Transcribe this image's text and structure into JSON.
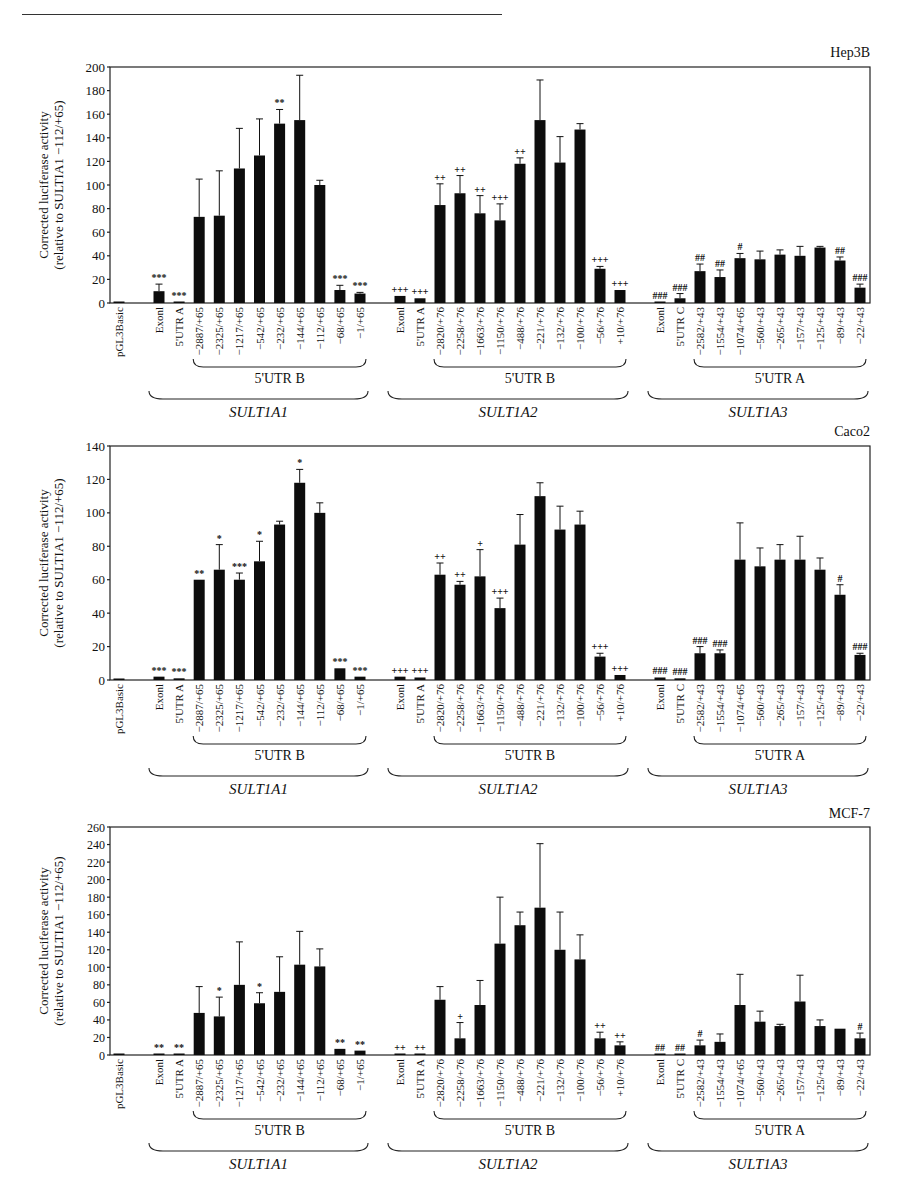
{
  "page": {
    "header_left": "[6]",
    "header_center": "RESEARCH ARTICLE"
  },
  "categories": [
    {
      "label": "pGL3Basic",
      "gene": "",
      "group": ""
    },
    {
      "label": "Exonl",
      "gene": "SULT1A1",
      "group": ""
    },
    {
      "label": "5'UTR A",
      "gene": "SULT1A1",
      "group": ""
    },
    {
      "label": "−2887/+65",
      "gene": "SULT1A1",
      "group": "5'UTR B"
    },
    {
      "label": "−2325/+65",
      "gene": "SULT1A1",
      "group": "5'UTR B"
    },
    {
      "label": "−1217/+65",
      "gene": "SULT1A1",
      "group": "5'UTR B"
    },
    {
      "label": "−542/+65",
      "gene": "SULT1A1",
      "group": "5'UTR B"
    },
    {
      "label": "−232/+65",
      "gene": "SULT1A1",
      "group": "5'UTR B"
    },
    {
      "label": "−144/+65",
      "gene": "SULT1A1",
      "group": "5'UTR B"
    },
    {
      "label": "−112/+65",
      "gene": "SULT1A1",
      "group": "5'UTR B"
    },
    {
      "label": "−68/+65",
      "gene": "SULT1A1",
      "group": "5'UTR B"
    },
    {
      "label": "−1/+65",
      "gene": "SULT1A1",
      "group": "5'UTR B"
    },
    {
      "label": "Exonl",
      "gene": "SULT1A2",
      "group": ""
    },
    {
      "label": "5'UTR A",
      "gene": "SULT1A2",
      "group": ""
    },
    {
      "label": "−2820/+76",
      "gene": "SULT1A2",
      "group": "5'UTR B"
    },
    {
      "label": "−2258/+76",
      "gene": "SULT1A2",
      "group": "5'UTR B"
    },
    {
      "label": "−1663/+76",
      "gene": "SULT1A2",
      "group": "5'UTR B"
    },
    {
      "label": "−1150/+76",
      "gene": "SULT1A2",
      "group": "5'UTR B"
    },
    {
      "label": "−488/+76",
      "gene": "SULT1A2",
      "group": "5'UTR B"
    },
    {
      "label": "−221/+76",
      "gene": "SULT1A2",
      "group": "5'UTR B"
    },
    {
      "label": "−132/+76",
      "gene": "SULT1A2",
      "group": "5'UTR B"
    },
    {
      "label": "−100/+76",
      "gene": "SULT1A2",
      "group": "5'UTR B"
    },
    {
      "label": "−56/+76",
      "gene": "SULT1A2",
      "group": "5'UTR B"
    },
    {
      "label": "+10/+76",
      "gene": "SULT1A2",
      "group": "5'UTR B"
    },
    {
      "label": "Exonl",
      "gene": "SULT1A3",
      "group": ""
    },
    {
      "label": "5'UTR C",
      "gene": "SULT1A3",
      "group": ""
    },
    {
      "label": "−2582/+43",
      "gene": "SULT1A3",
      "group": "5'UTR A"
    },
    {
      "label": "−1554/+43",
      "gene": "SULT1A3",
      "group": "5'UTR A"
    },
    {
      "label": "−1074/+65",
      "gene": "SULT1A3",
      "group": "5'UTR A"
    },
    {
      "label": "−560/+43",
      "gene": "SULT1A3",
      "group": "5'UTR A"
    },
    {
      "label": "−265/+43",
      "gene": "SULT1A3",
      "group": "5'UTR A"
    },
    {
      "label": "−157/+43",
      "gene": "SULT1A3",
      "group": "5'UTR A"
    },
    {
      "label": "−125/+43",
      "gene": "SULT1A3",
      "group": "5'UTR A"
    },
    {
      "label": "−89/+43",
      "gene": "SULT1A3",
      "group": "5'UTR A"
    },
    {
      "label": "−22/+43",
      "gene": "SULT1A3",
      "group": "5'UTR A"
    }
  ],
  "gene_groups": [
    {
      "gene": "SULT1A1",
      "subgroup": "5'UTR B"
    },
    {
      "gene": "SULT1A2",
      "subgroup": "5'UTR B"
    },
    {
      "gene": "SULT1A3",
      "subgroup": "5'UTR A"
    }
  ],
  "ylabel_line1": "Corrected luciferase activity",
  "ylabel_line2": "(relative to SULTIA1 −112/+65)",
  "chart_data": [
    {
      "type": "bar",
      "title": "Hep3B",
      "xlabel": "",
      "ylabel": "Corrected luciferase activity (relative to SULTIA1 −112/+65)",
      "ylim": [
        0,
        200
      ],
      "yticks": [
        0,
        20,
        40,
        60,
        80,
        100,
        120,
        140,
        160,
        180,
        200
      ],
      "grid": false,
      "values": [
        1,
        10,
        1,
        73,
        74,
        114,
        125,
        152,
        155,
        100,
        11,
        8,
        6,
        4,
        83,
        93,
        76,
        70,
        118,
        155,
        119,
        147,
        29,
        11,
        1,
        4,
        27,
        22,
        38,
        37,
        41,
        40,
        47,
        36,
        13
      ],
      "errors": [
        0,
        6,
        0,
        32,
        38,
        34,
        31,
        12,
        38,
        4,
        4,
        1,
        0,
        0,
        18,
        15,
        15,
        14,
        5,
        34,
        22,
        5,
        2,
        0,
        0,
        4,
        6,
        6,
        4,
        7,
        4,
        8,
        1,
        3,
        3
      ],
      "annotations": [
        "",
        "***",
        "***",
        "",
        "",
        "",
        "",
        "**",
        "",
        "",
        "***",
        "***",
        "+++",
        "+++",
        "++",
        "++",
        "++",
        "+++",
        "++",
        "",
        "",
        "",
        "+++",
        "+++",
        "###",
        "###",
        "##",
        "##",
        "#",
        "",
        "",
        "",
        "",
        "##",
        "###"
      ]
    },
    {
      "type": "bar",
      "title": "Caco2",
      "xlabel": "",
      "ylabel": "Corrected luciferase activity (relative to SULTIA1 −112/+65)",
      "ylim": [
        0,
        140
      ],
      "yticks": [
        0,
        20,
        40,
        60,
        80,
        100,
        120,
        140
      ],
      "grid": false,
      "values": [
        0.5,
        2,
        1,
        60,
        66,
        60,
        71,
        93,
        118,
        100,
        7,
        2,
        2,
        1.5,
        63,
        57,
        62,
        43,
        81,
        110,
        90,
        93,
        14,
        3,
        1.5,
        1,
        16,
        16,
        72,
        68,
        72,
        72,
        66,
        51,
        15
      ],
      "errors": [
        0,
        0,
        0,
        0,
        15,
        4,
        12,
        2,
        8,
        6,
        0,
        0,
        0,
        0,
        7,
        2,
        16,
        6,
        18,
        8,
        14,
        8,
        2,
        0,
        0,
        0,
        4,
        2,
        22,
        11,
        9,
        14,
        7,
        6,
        1
      ],
      "annotations": [
        "",
        "***",
        "***",
        "**",
        "*",
        "***",
        "*",
        "",
        "*",
        "",
        "***",
        "***",
        "+++",
        "+++",
        "++",
        "++",
        "+",
        "+++",
        "",
        "",
        "",
        "",
        "+++",
        "+++",
        "###",
        "###",
        "###",
        "###",
        "",
        "",
        "",
        "",
        "",
        "#",
        "###"
      ]
    },
    {
      "type": "bar",
      "title": "MCF-7",
      "xlabel": "",
      "ylabel": "Corrected luciferase activity (relative to SULTIA1 −112/+65)",
      "ylim": [
        0,
        260
      ],
      "yticks": [
        0,
        20,
        40,
        60,
        80,
        100,
        120,
        140,
        160,
        180,
        200,
        220,
        240,
        260
      ],
      "grid": false,
      "values": [
        1,
        1,
        1,
        48,
        44,
        80,
        59,
        72,
        103,
        101,
        7,
        5,
        1,
        1,
        63,
        19,
        57,
        127,
        148,
        168,
        120,
        109,
        19,
        11,
        1,
        1,
        11,
        15,
        57,
        38,
        33,
        61,
        33,
        30,
        19
      ],
      "errors": [
        0,
        0,
        0,
        30,
        22,
        49,
        12,
        40,
        38,
        20,
        0,
        0,
        0,
        0,
        15,
        18,
        28,
        53,
        15,
        73,
        43,
        28,
        7,
        4,
        0,
        0,
        6,
        9,
        35,
        12,
        2,
        30,
        7,
        0,
        6
      ],
      "annotations": [
        "",
        "**",
        "**",
        "",
        "*",
        "",
        "*",
        "",
        "",
        "",
        "**",
        "**",
        "++",
        "++",
        "",
        "+",
        "",
        "",
        "",
        "",
        "",
        "",
        "++",
        "++",
        "##",
        "##",
        "#",
        "",
        "",
        "",
        "",
        "",
        "",
        "",
        "#"
      ]
    }
  ]
}
